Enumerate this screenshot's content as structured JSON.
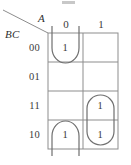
{
  "figure": {
    "type": "karnaugh-map",
    "row_variable_label": "BC",
    "column_variable_label": "A"
  },
  "columns": [
    {
      "label": "0"
    },
    {
      "label": "1"
    }
  ],
  "rows": [
    {
      "label": "00"
    },
    {
      "label": "01"
    },
    {
      "label": "11"
    },
    {
      "label": "10"
    }
  ],
  "cells": [
    {
      "row": "00",
      "col": "0",
      "value": "1"
    },
    {
      "row": "00",
      "col": "1",
      "value": ""
    },
    {
      "row": "01",
      "col": "0",
      "value": ""
    },
    {
      "row": "01",
      "col": "1",
      "value": ""
    },
    {
      "row": "11",
      "col": "0",
      "value": ""
    },
    {
      "row": "11",
      "col": "1",
      "value": "1"
    },
    {
      "row": "10",
      "col": "0",
      "value": "1"
    },
    {
      "row": "10",
      "col": "1",
      "value": "1"
    }
  ],
  "visible_cell_values": {
    "r00c0": "1",
    "r11c1": "1",
    "r10c0": "1",
    "r10c1": "1"
  },
  "groupings": [
    {
      "name": "wraparound-group-left-column",
      "cells": [
        "A=0,BC=00",
        "A=0,BC=10"
      ],
      "style": "split-oval"
    },
    {
      "name": "group-right-column-11-10",
      "cells": [
        "A=1,BC=11",
        "A=1,BC=10"
      ],
      "style": "rounded-oval"
    }
  ],
  "colors": {
    "grid_line": "#8d8d8d",
    "oval_line": "#6f6f6f",
    "text": "#3a3a3a"
  }
}
